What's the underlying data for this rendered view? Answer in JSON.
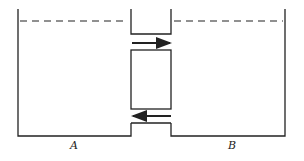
{
  "diagram": {
    "labels": {
      "left": "A",
      "right": "B"
    },
    "arrows": [
      {
        "position": "upper-channel",
        "direction": "right"
      },
      {
        "position": "lower-channel",
        "direction": "left"
      }
    ],
    "colors": {
      "stroke": "#222222",
      "background": "#ffffff"
    }
  }
}
